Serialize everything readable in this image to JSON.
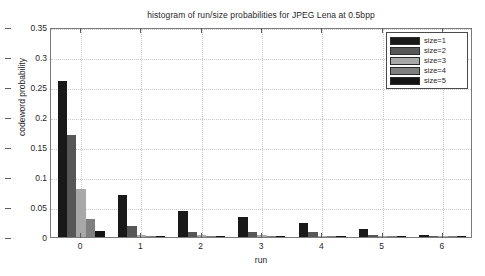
{
  "chart_data": {
    "type": "bar",
    "title": "histogram of run/size probabilities for JPEG Lena at 0.5bpp",
    "xlabel": "run",
    "ylabel": "codeword probability",
    "categories": [
      "0",
      "1",
      "2",
      "3",
      "4",
      "5",
      "6"
    ],
    "xlim": [
      -0.5,
      6.5
    ],
    "ylim": [
      0,
      0.35
    ],
    "yticks": [
      "0",
      "0.05",
      "0.1",
      "0.15",
      "0.2",
      "0.25",
      "0.3",
      "0.35"
    ],
    "ytick_values": [
      0,
      0.05,
      0.1,
      0.15,
      0.2,
      0.25,
      0.3,
      0.35
    ],
    "xticks": [
      "0",
      "1",
      "2",
      "3",
      "4",
      "5",
      "6"
    ],
    "grid": "both-dotted",
    "legend_position": "top-right",
    "series": [
      {
        "name": "size=1",
        "color": "#191919",
        "values": [
          0.26,
          0.07,
          0.044,
          0.034,
          0.023,
          0.013,
          0.003
        ]
      },
      {
        "name": "size=2",
        "color": "#575757",
        "values": [
          0.17,
          0.019,
          0.009,
          0.009,
          0.008,
          0.004,
          0.001
        ]
      },
      {
        "name": "size=3",
        "color": "#a8a8a8",
        "values": [
          0.08,
          0.004,
          0.004,
          0.003,
          0.002,
          0.001,
          0.0005
        ]
      },
      {
        "name": "size=4",
        "color": "#7f7f7f",
        "values": [
          0.03,
          0.0012,
          0.0008,
          0.0006,
          0.0004,
          0.0002,
          0.0001
        ]
      },
      {
        "name": "size=5",
        "color": "#141414",
        "values": [
          0.01,
          0.0004,
          0.0003,
          0.0002,
          0.0001,
          0.0001,
          0.0001
        ]
      }
    ]
  },
  "legend": {
    "entries": [
      {
        "label": "size=1",
        "color": "#191919"
      },
      {
        "label": "size=2",
        "color": "#575757"
      },
      {
        "label": "size=3",
        "color": "#a8a8a8"
      },
      {
        "label": "size=4",
        "color": "#7f7f7f"
      },
      {
        "label": "size=5",
        "color": "#141414"
      }
    ]
  },
  "colors": {
    "axis": "#7a7a7a",
    "grid": "#c9c9c9",
    "text": "#1f1f1f",
    "background": "#ffffff"
  }
}
